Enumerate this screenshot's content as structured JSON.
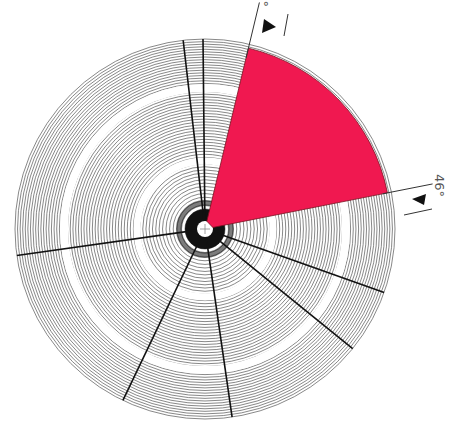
{
  "diagram": {
    "type": "polar-sector-diagram",
    "center": {
      "x": 205,
      "y": 229
    },
    "outer_radius": 190,
    "ring_count": 60,
    "ring_color": "#555555",
    "gap_rings": [
      {
        "radius": 68,
        "width": 7,
        "color": "#ffffff"
      },
      {
        "radius": 141,
        "width": 8,
        "color": "#ffffff"
      }
    ],
    "hub": {
      "dark_radius": 20,
      "hole_radius": 8,
      "dark_color": "#111111"
    },
    "radial_lines_deg": [
      -96.6,
      -90.6,
      172,
      115.6,
      81.8,
      39,
      19.5
    ],
    "radial_line_color": "#111111",
    "sector": {
      "start_deg": -76.5,
      "end_deg": -11.2,
      "radius": 186,
      "color": "#F01850",
      "edge_color": "#7a1020"
    },
    "markers": [
      {
        "name": "top-edge-marker",
        "label": "8°",
        "line_end_deg": -76.5,
        "arrow": "right-pointing"
      },
      {
        "name": "right-edge-marker",
        "label": "46°",
        "line_end_deg": -11.2,
        "arrow": "left-pointing"
      }
    ]
  },
  "labels": {
    "top_angle": "8°",
    "right_angle": "46°"
  }
}
